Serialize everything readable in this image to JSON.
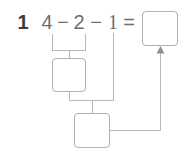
{
  "worksheet": {
    "problem_number": "1",
    "expression": {
      "operand_a": "4",
      "operator_1": "−",
      "operand_b": "2",
      "operator_2": "−",
      "operand_c": "1",
      "equals": "="
    },
    "answer_boxes": [
      {
        "name": "result-box",
        "value": ""
      },
      {
        "name": "first-step-box",
        "value": ""
      },
      {
        "name": "second-step-box",
        "value": ""
      }
    ],
    "colors": {
      "number_bold": "#3d3d3d",
      "expression_gray": "#6f6f6f",
      "box_border": "#b0b0b0",
      "connector": "#b8b8b8",
      "background": "#ffffff"
    }
  }
}
